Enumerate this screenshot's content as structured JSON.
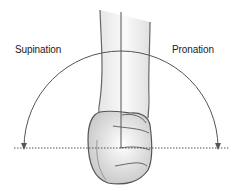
{
  "diagram": {
    "labels": {
      "left": "Supination",
      "right": "Pronation"
    },
    "elements": {
      "forearm": "forearm viewed end-on, pointing upward",
      "fist": "clenched fist with knuckles",
      "midline": "vertical reference line through forearm",
      "baseline": "horizontal dotted reference line",
      "arc": "semicircular arc with arrowheads at both ends"
    },
    "colors": {
      "stroke": "#555555",
      "fill_light": "#f2f2f2",
      "fill_mid": "#d9d9d9",
      "text": "#222222"
    }
  }
}
